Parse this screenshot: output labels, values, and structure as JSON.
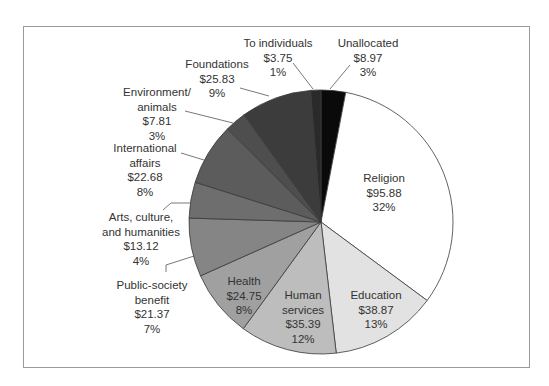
{
  "chart_data": {
    "type": "pie",
    "title": "",
    "units": "USD billions",
    "center": [
      321,
      222
    ],
    "radius": 132,
    "start_angle_deg": 0,
    "direction": "clockwise",
    "slices": [
      {
        "name": "Unallocated",
        "label_lines": [
          "Unallocated"
        ],
        "value": 8.97,
        "value_label": "$8.97",
        "percent": "3%",
        "color": "#0a0a0a"
      },
      {
        "name": "Religion",
        "label_lines": [
          "Religion"
        ],
        "value": 95.88,
        "value_label": "$95.88",
        "percent": "32%",
        "color": "#ffffff"
      },
      {
        "name": "Education",
        "label_lines": [
          "Education"
        ],
        "value": 38.87,
        "value_label": "$38.87",
        "percent": "13%",
        "color": "#e2e2e2"
      },
      {
        "name": "Human services",
        "label_lines": [
          "Human",
          "services"
        ],
        "value": 35.39,
        "value_label": "$35.39",
        "percent": "12%",
        "color": "#bdbdbd"
      },
      {
        "name": "Health",
        "label_lines": [
          "Health"
        ],
        "value": 24.75,
        "value_label": "$24.75",
        "percent": "8%",
        "color": "#a0a0a0"
      },
      {
        "name": "Public-society benefit",
        "label_lines": [
          "Public-society",
          "benefit"
        ],
        "value": 21.37,
        "value_label": "$21.37",
        "percent": "7%",
        "color": "#858585"
      },
      {
        "name": "Arts, culture, and humanities",
        "label_lines": [
          "Arts, culture,",
          "and humanities"
        ],
        "value": 13.12,
        "value_label": "$13.12",
        "percent": "4%",
        "color": "#6e6e6e"
      },
      {
        "name": "International affairs",
        "label_lines": [
          "International",
          "affairs"
        ],
        "value": 22.68,
        "value_label": "$22.68",
        "percent": "8%",
        "color": "#5c5c5c"
      },
      {
        "name": "Environment/animals",
        "label_lines": [
          "Environment/",
          "animals"
        ],
        "value": 7.81,
        "value_label": "$7.81",
        "percent": "3%",
        "color": "#4e4e4e"
      },
      {
        "name": "Foundations",
        "label_lines": [
          "Foundations"
        ],
        "value": 25.83,
        "value_label": "$25.83",
        "percent": "9%",
        "color": "#3c3c3c"
      },
      {
        "name": "To individuals",
        "label_lines": [
          "To individuals"
        ],
        "value": 3.75,
        "value_label": "$3.75",
        "percent": "1%",
        "color": "#2a2a2a"
      }
    ],
    "labels": [
      {
        "slice": 0,
        "x": 368,
        "y": 36,
        "leader": [
          [
            350,
            65
          ],
          [
            330,
            89
          ]
        ]
      },
      {
        "slice": 1,
        "x": 384,
        "y": 171,
        "leader": null
      },
      {
        "slice": 2,
        "x": 376,
        "y": 288,
        "leader": null
      },
      {
        "slice": 3,
        "x": 303,
        "y": 288,
        "leader": null
      },
      {
        "slice": 4,
        "x": 244,
        "y": 274,
        "leader": null
      },
      {
        "slice": 5,
        "x": 152,
        "y": 278,
        "leader": [
          [
            166,
            272
          ],
          [
            166,
            265
          ],
          [
            194,
            256
          ]
        ]
      },
      {
        "slice": 6,
        "x": 141,
        "y": 210,
        "leader": [
          [
            163,
            210
          ],
          [
            171,
            203
          ],
          [
            191,
            203
          ]
        ]
      },
      {
        "slice": 7,
        "x": 145,
        "y": 141,
        "leader": [
          [
            181,
            153
          ],
          [
            204,
            160
          ]
        ]
      },
      {
        "slice": 8,
        "x": 157,
        "y": 85,
        "leader": [
          [
            185,
            111
          ],
          [
            233,
            123
          ]
        ]
      },
      {
        "slice": 9,
        "x": 217,
        "y": 57,
        "leader": [
          [
            240,
            88
          ],
          [
            269,
            96
          ]
        ]
      },
      {
        "slice": 10,
        "x": 278,
        "y": 36,
        "leader": [
          [
            293,
            63
          ],
          [
            313,
            89
          ]
        ]
      }
    ]
  }
}
